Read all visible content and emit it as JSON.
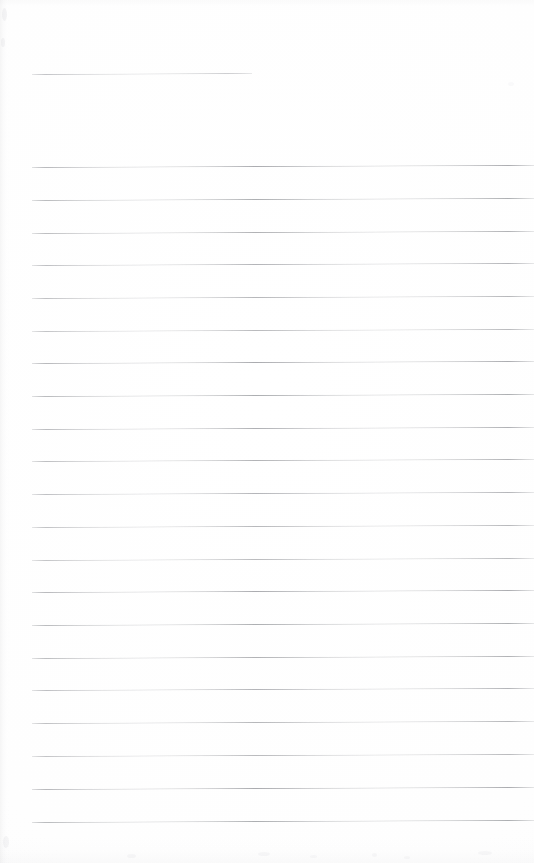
{
  "document": {
    "kind": "scanned-ruled-notebook-page",
    "title": "Blank Ruled Page",
    "page_width": 534,
    "page_height": 863,
    "background_color": "#ffffff",
    "rule_color": "#787a80",
    "content_text": "",
    "is_blank": true
  },
  "header_rule": {
    "name": "header-rule",
    "x": 32,
    "y": 74,
    "width": 220,
    "right_rise": 1
  },
  "body_rules": {
    "left_x": 32,
    "right_x": 534,
    "first_y": 167,
    "spacing": 32.7,
    "right_rise": 2,
    "count": 21,
    "lines": [
      {
        "index": 1,
        "y": 167
      },
      {
        "index": 2,
        "y": 200
      },
      {
        "index": 3,
        "y": 233
      },
      {
        "index": 4,
        "y": 265
      },
      {
        "index": 5,
        "y": 298
      },
      {
        "index": 6,
        "y": 331
      },
      {
        "index": 7,
        "y": 363
      },
      {
        "index": 8,
        "y": 396
      },
      {
        "index": 9,
        "y": 429
      },
      {
        "index": 10,
        "y": 461
      },
      {
        "index": 11,
        "y": 494
      },
      {
        "index": 12,
        "y": 527
      },
      {
        "index": 13,
        "y": 560
      },
      {
        "index": 14,
        "y": 592
      },
      {
        "index": 15,
        "y": 625
      },
      {
        "index": 16,
        "y": 658
      },
      {
        "index": 17,
        "y": 690
      },
      {
        "index": 18,
        "y": 723
      },
      {
        "index": 19,
        "y": 756
      },
      {
        "index": 20,
        "y": 789
      },
      {
        "index": 21,
        "y": 822
      }
    ]
  },
  "scan_artifacts": {
    "specks": [
      {
        "x": 2,
        "y": 8,
        "w": 5,
        "h": 13,
        "opacity": 0.1
      },
      {
        "x": 1,
        "y": 38,
        "w": 4,
        "h": 9,
        "opacity": 0.09
      },
      {
        "x": 3,
        "y": 836,
        "w": 6,
        "h": 12,
        "opacity": 0.09
      },
      {
        "x": 127,
        "y": 854,
        "w": 9,
        "h": 4,
        "opacity": 0.07
      },
      {
        "x": 258,
        "y": 852,
        "w": 12,
        "h": 4,
        "opacity": 0.07
      },
      {
        "x": 310,
        "y": 855,
        "w": 7,
        "h": 3,
        "opacity": 0.06
      },
      {
        "x": 372,
        "y": 853,
        "w": 5,
        "h": 4,
        "opacity": 0.07
      },
      {
        "x": 404,
        "y": 856,
        "w": 6,
        "h": 3,
        "opacity": 0.06
      },
      {
        "x": 478,
        "y": 851,
        "w": 14,
        "h": 4,
        "opacity": 0.07
      },
      {
        "x": 508,
        "y": 82,
        "w": 6,
        "h": 4,
        "opacity": 0.05
      }
    ]
  }
}
